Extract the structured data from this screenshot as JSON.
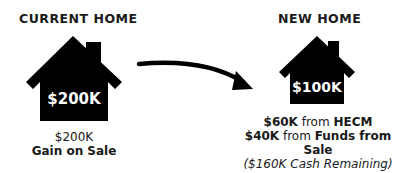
{
  "current_home": {
    "heading": "CURRENT HOME",
    "house_value": "$200K",
    "caption_amount": "$200K",
    "caption_label": "Gain on Sale"
  },
  "new_home": {
    "heading": "NEW HOME",
    "house_value": "$100K",
    "lines": [
      {
        "amount": "$60K from ",
        "source": "HECM"
      },
      {
        "amount": "$40K from ",
        "source": "Funds from Sale"
      }
    ],
    "remaining_note": "($160K Cash Remaining)"
  },
  "colors": {
    "house_fill": "#000000",
    "text": "#1a1a1a",
    "arrow": "#000000"
  },
  "icons": {
    "house": "house-icon",
    "arrow": "curved-arrow-icon"
  }
}
